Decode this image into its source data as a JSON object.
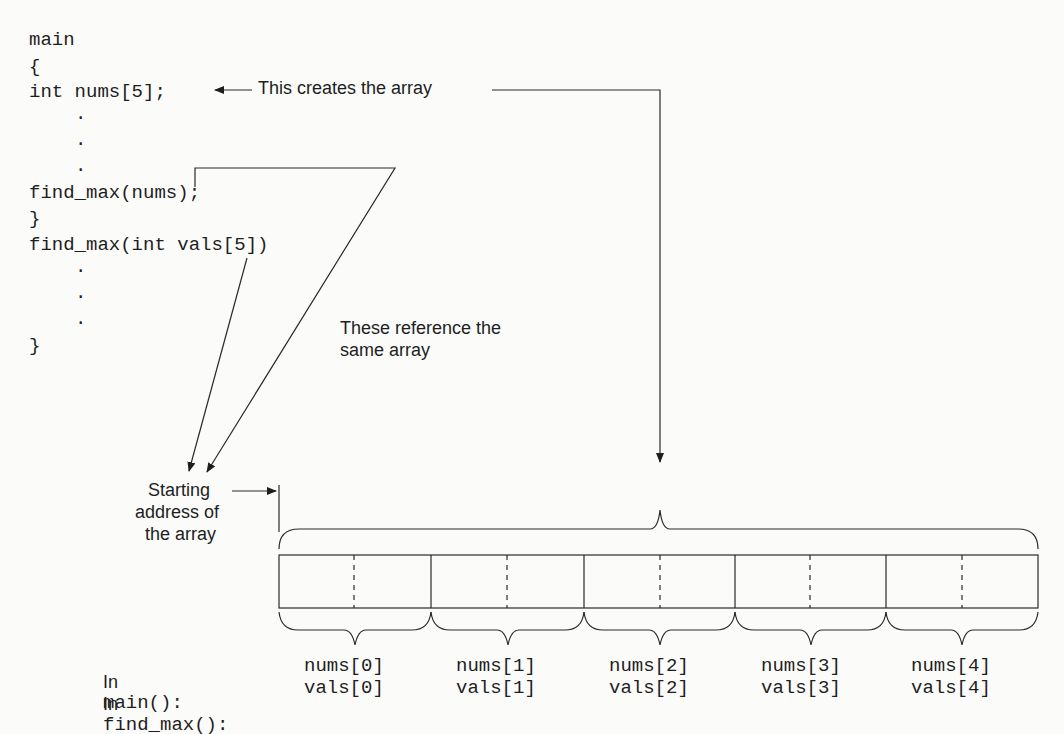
{
  "code": {
    "lines": [
      "main",
      "{",
      "int nums[5];",
      ".",
      ".",
      ".",
      "find_max(nums);",
      "}",
      "find_max(int vals[5])",
      ".",
      ".",
      ".",
      "}"
    ]
  },
  "annotations": {
    "creates": "This creates the array",
    "reference_line1": "These reference the",
    "reference_line2": "same array",
    "start_line1": "Starting",
    "start_line2": "address of",
    "start_line3": "the array"
  },
  "rows": {
    "main_prefix": "In",
    "main_fn": "main():",
    "find_prefix": "In",
    "find_fn": "find_max():"
  },
  "elements": {
    "nums": [
      "nums[0]",
      "nums[1]",
      "nums[2]",
      "nums[3]",
      "nums[4]"
    ],
    "vals": [
      "vals[0]",
      "vals[1]",
      "vals[2]",
      "vals[3]",
      "vals[4]"
    ]
  }
}
